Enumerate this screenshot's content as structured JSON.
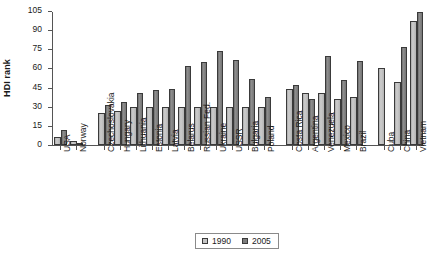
{
  "chart_data": {
    "type": "bar",
    "title": "",
    "subtitle": "",
    "xlabel": "",
    "ylabel": "HDI rank",
    "ylim": [
      0,
      105
    ],
    "yticks": [
      0,
      15,
      30,
      45,
      60,
      75,
      90,
      105
    ],
    "grid": false,
    "legend_position": "bottom-center",
    "categories": [
      "USA",
      "Norway",
      "Czechoslovakia",
      "Hungary",
      "Lithuania",
      "Estonia",
      "Latvia",
      "Belarus",
      "Russian Fed.",
      "Ukraine",
      "USSR",
      "Bulgaria",
      "Poland",
      "Costa Rica",
      "Argentina",
      "Venezuela",
      "Mexico",
      "Brazil",
      "Cuba",
      "China",
      "Vietnam"
    ],
    "group_breaks": [
      2,
      13,
      18
    ],
    "series": [
      {
        "name": "1990",
        "color": "#c4c4c4",
        "values": [
          6,
          3,
          25,
          27,
          30,
          30,
          30,
          30,
          30,
          30,
          30,
          30,
          30,
          44,
          41,
          41,
          36,
          38,
          60,
          49,
          97
        ]
      },
      {
        "name": "2005",
        "color": "#7d7d7d",
        "values": [
          12,
          1,
          31,
          34,
          41,
          43,
          44,
          62,
          65,
          74,
          67,
          52,
          38,
          47,
          36,
          70,
          51,
          66,
          0,
          77,
          104
        ]
      }
    ]
  },
  "legend": {
    "items": [
      {
        "label": "1990",
        "key": "y1990"
      },
      {
        "label": "2005",
        "key": "y2005"
      }
    ]
  }
}
